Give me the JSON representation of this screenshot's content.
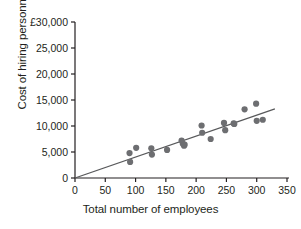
{
  "chart_data": {
    "type": "scatter",
    "title": "",
    "xlabel": "Total number of employees",
    "ylabel": "Cost of hiring personnel",
    "currency_symbol": "£",
    "xlim": [
      0,
      350
    ],
    "ylim": [
      0,
      30000
    ],
    "xticks": [
      0,
      50,
      100,
      150,
      200,
      250,
      300,
      350
    ],
    "xtick_labels": [
      "0",
      "50",
      "100",
      "150",
      "200",
      "250",
      "300",
      "350"
    ],
    "yticks": [
      0,
      5000,
      10000,
      15000,
      20000,
      25000,
      30000
    ],
    "ytick_labels": [
      "0",
      "5,000",
      "10,000",
      "15,000",
      "20,000",
      "25,000",
      "£30,000"
    ],
    "grid": false,
    "legend": false,
    "point_color": "#6d6e71",
    "line_color": "#58595b",
    "axis_color": "#231f20",
    "points": [
      {
        "x": 90,
        "y": 4800
      },
      {
        "x": 91,
        "y": 3100
      },
      {
        "x": 101,
        "y": 5800
      },
      {
        "x": 126,
        "y": 5700
      },
      {
        "x": 127,
        "y": 4500
      },
      {
        "x": 152,
        "y": 5400
      },
      {
        "x": 176,
        "y": 7200
      },
      {
        "x": 178,
        "y": 6600
      },
      {
        "x": 180,
        "y": 6200
      },
      {
        "x": 181,
        "y": 6400
      },
      {
        "x": 209,
        "y": 10100
      },
      {
        "x": 210,
        "y": 8700
      },
      {
        "x": 224,
        "y": 7500
      },
      {
        "x": 246,
        "y": 10600
      },
      {
        "x": 248,
        "y": 9200
      },
      {
        "x": 262,
        "y": 10500
      },
      {
        "x": 263,
        "y": 10400
      },
      {
        "x": 280,
        "y": 13200
      },
      {
        "x": 299,
        "y": 14300
      },
      {
        "x": 300,
        "y": 11000
      },
      {
        "x": 310,
        "y": 11200
      }
    ],
    "trendline": {
      "x0": 0,
      "y0": 0,
      "x1": 330,
      "y1": 13300,
      "slope": 40.3,
      "intercept": 0
    }
  }
}
